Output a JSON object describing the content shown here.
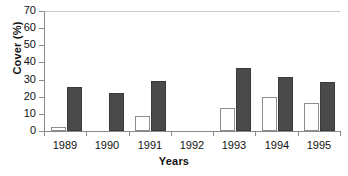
{
  "chart_data": {
    "type": "bar",
    "title": "",
    "xlabel": "Years",
    "ylabel": "Cover (%)",
    "categories": [
      "1989",
      "1990",
      "1991",
      "1992",
      "1993",
      "1994",
      "1995"
    ],
    "ylim": [
      0,
      70
    ],
    "yticks": [
      0,
      10,
      20,
      30,
      40,
      50,
      60,
      70
    ],
    "ytick_labels": [
      "0",
      "10",
      "20",
      "30",
      "40",
      "50",
      "60",
      "70"
    ],
    "grid": false,
    "legend": "none",
    "series": [
      {
        "name": "open-series",
        "style": "open",
        "color": "#ffffff",
        "edge_color": "#8d8d8d",
        "values": [
          2.3,
          0,
          8.7,
          0,
          13.5,
          20.0,
          16.5
        ]
      },
      {
        "name": "filled-series",
        "style": "filled",
        "color": "#4a4a4a",
        "edge_color": "#3a3a3a",
        "values": [
          25.7,
          22.0,
          29.2,
          0,
          36.8,
          31.5,
          28.7
        ]
      }
    ]
  },
  "axis": {
    "axis_color": "#8a8a8a",
    "top_border_color": "#c9c9c9"
  }
}
